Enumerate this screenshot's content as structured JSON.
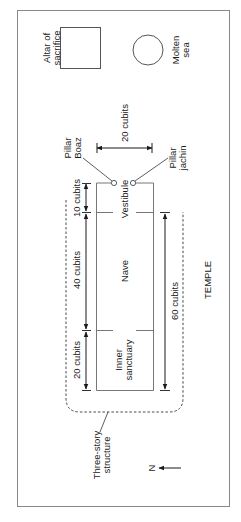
{
  "diagram": {
    "title": "TEMPLE",
    "orientation": "rotated 90 degrees clockwise; text reads bottom-to-top",
    "objects": {
      "altar": {
        "label_line1": "Altar of",
        "label_line2": "sacrifice",
        "shape": "square"
      },
      "molten_sea": {
        "label_line1": "Molten",
        "label_line2": "sea",
        "shape": "circle"
      },
      "pillar_boaz": {
        "label_line1": "Pillar",
        "label_line2": "Boaz"
      },
      "pillar_jachin": {
        "label_line1": "Pillar",
        "label_line2": "jachin"
      }
    },
    "rooms": {
      "vestibule": "Vestibule",
      "nave": "Nave",
      "inner_sanctuary_line1": "Inner",
      "inner_sanctuary_line2": "sanctuary"
    },
    "dimensions": {
      "width": "20 cubits",
      "vestibule_length": "10 cubits",
      "nave_length": "40 cubits",
      "sanctuary_length": "20 cubits",
      "total_length": "60 cubits"
    },
    "structure": {
      "label_line1": "Three-story",
      "label_line2": "structure"
    },
    "compass": {
      "label": "N",
      "icon": "arrow-left"
    }
  }
}
